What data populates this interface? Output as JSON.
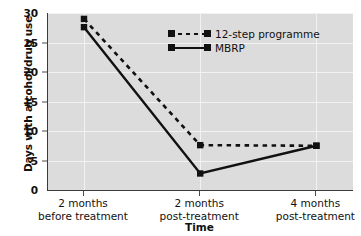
{
  "chart_data": {
    "type": "line",
    "title": "",
    "xlabel": "Time",
    "ylabel": "Days with alcohol/drug use",
    "categories": [
      "2 months before treatment",
      "2 months post-treatment",
      "4 months post-treatment"
    ],
    "category_lines": [
      [
        "2 months",
        "before treatment"
      ],
      [
        "2 months",
        "post-treatment"
      ],
      [
        "4 months",
        "post-treatment"
      ]
    ],
    "series": [
      {
        "name": "12-step programme",
        "style": "dashed",
        "marker": "square",
        "color": "#111111",
        "values": [
          29,
          7.6,
          7.5
        ]
      },
      {
        "name": "MBRP",
        "style": "solid",
        "marker": "square",
        "color": "#111111",
        "values": [
          27.6,
          2.8,
          7.5
        ]
      }
    ],
    "ylim": [
      0,
      30
    ],
    "yticks": [
      0,
      5,
      10,
      15,
      20,
      25,
      30
    ],
    "ytick_labels": [
      "0",
      "5",
      "10",
      "15",
      "20",
      "25",
      "30"
    ],
    "grid": true,
    "grid_color": "#f2f2f2",
    "plot_background": "#dcdcdc",
    "legend_position": "upper-center"
  },
  "legend": {
    "items": [
      {
        "label": "12-step programme",
        "style": "dashed"
      },
      {
        "label": "MBRP",
        "style": "solid"
      }
    ]
  },
  "axes": {
    "x_title": "Time",
    "y_title": "Days with alcohol/drug use"
  }
}
